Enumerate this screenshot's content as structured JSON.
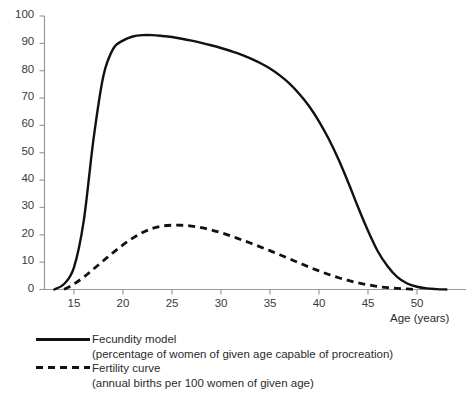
{
  "chart_data": {
    "type": "line",
    "title": "",
    "xlabel": "Age (years)",
    "ylabel": "",
    "xlim": [
      12,
      55
    ],
    "ylim": [
      0,
      100
    ],
    "grid": false,
    "legend_position": "below-axes-left",
    "x_ticks": [
      15,
      20,
      25,
      30,
      35,
      40,
      45,
      50
    ],
    "y_ticks": [
      0,
      10,
      20,
      30,
      40,
      50,
      60,
      70,
      80,
      90,
      100
    ],
    "series": [
      {
        "name": "Fecundity model",
        "description": "percentage of women of given age capable of procreation",
        "style": "solid",
        "color": "#111111",
        "x": [
          13,
          14,
          15,
          16,
          17,
          18,
          19,
          20,
          21,
          22,
          23,
          24,
          25,
          26,
          27,
          28,
          29,
          30,
          31,
          32,
          33,
          34,
          35,
          36,
          37,
          38,
          39,
          40,
          41,
          42,
          43,
          44,
          45,
          46,
          47,
          48,
          49,
          50,
          51,
          52,
          53
        ],
        "y": [
          0,
          2,
          8,
          25,
          55,
          78,
          88,
          91,
          92.5,
          93,
          93,
          92.7,
          92.3,
          91.7,
          91,
          90.2,
          89.3,
          88.3,
          87.2,
          86,
          84.5,
          82.8,
          80.8,
          78.3,
          75.3,
          71.5,
          67,
          61.5,
          55,
          47.5,
          39,
          30,
          21.5,
          14,
          8.5,
          4.5,
          2.2,
          1,
          0.4,
          0.15,
          0
        ]
      },
      {
        "name": "Fertility curve",
        "description": "annual births per 100 women of given age",
        "style": "dashed",
        "color": "#111111",
        "x": [
          14,
          15,
          16,
          17,
          18,
          19,
          20,
          21,
          22,
          23,
          24,
          25,
          26,
          27,
          28,
          29,
          30,
          31,
          32,
          33,
          34,
          35,
          36,
          37,
          38,
          39,
          40,
          41,
          42,
          43,
          44,
          45,
          46,
          47,
          48,
          49,
          50
        ],
        "y": [
          0,
          2,
          4.5,
          7.5,
          10.5,
          13.5,
          16.3,
          18.8,
          20.8,
          22.3,
          23.2,
          23.5,
          23.5,
          23.2,
          22.6,
          21.8,
          20.8,
          19.6,
          18.3,
          17,
          15.6,
          14.2,
          12.7,
          11.2,
          9.7,
          8.2,
          6.8,
          5.5,
          4.3,
          3.3,
          2.4,
          1.7,
          1.1,
          0.7,
          0.4,
          0.2,
          0
        ]
      }
    ]
  },
  "axis": {
    "x_tick_labels": [
      "15",
      "20",
      "25",
      "30",
      "35",
      "40",
      "45",
      "50"
    ],
    "y_tick_labels": [
      "0",
      "10",
      "20",
      "30",
      "40",
      "50",
      "60",
      "70",
      "80",
      "90",
      "100"
    ],
    "x_axis_title": "Age (years)"
  },
  "legend": {
    "entries": [
      {
        "label": "Fecundity model",
        "sublabel": "(percentage of women of given age capable of procreation)",
        "style": "solid"
      },
      {
        "label": "Fertility curve",
        "sublabel": "(annual births per 100 women of given age)",
        "style": "dashed"
      }
    ]
  },
  "footnote": {
    "text": ""
  }
}
